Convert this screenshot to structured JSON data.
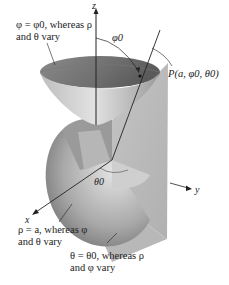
{
  "figure": {
    "axes": {
      "x": "x",
      "y": "y",
      "z": "z"
    },
    "angle_labels": {
      "phi0": "φ0",
      "theta0": "θ0"
    },
    "point_label": "P(a, φ0, θ0)",
    "annotations": [
      {
        "id": "cone",
        "line1": "φ = φ0, whereas ρ",
        "line2": "and θ vary"
      },
      {
        "id": "sphere",
        "line1": "ρ = a, whereas φ",
        "line2": "and θ vary"
      },
      {
        "id": "halfplane",
        "line1": "θ = θ0, whereas ρ",
        "line2": "and φ vary"
      }
    ],
    "colors": {
      "surface_light": "#d8d8d8",
      "surface_mid": "#a8a8a8",
      "surface_dark": "#6e6e6e",
      "line": "#222222",
      "background": "#ffffff"
    }
  }
}
